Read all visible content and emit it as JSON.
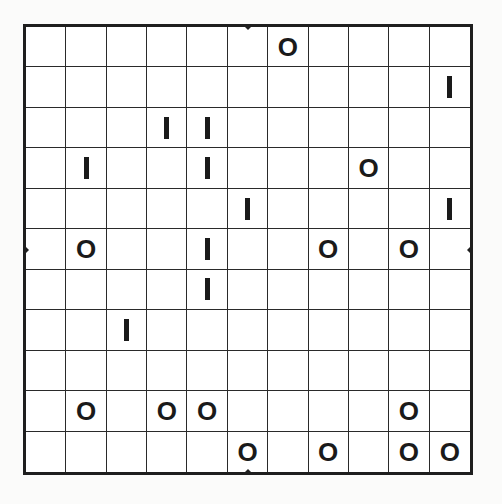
{
  "puzzle": {
    "rows": 11,
    "cols": 11,
    "colors": {
      "background": "#fbfbfa",
      "board": "#ffffff",
      "lines": "#2a2a2a",
      "glyph": "#1a1a1a"
    },
    "edge_markers": [
      {
        "side": "top",
        "position": "center"
      },
      {
        "side": "bottom",
        "position": "center"
      },
      {
        "side": "left",
        "position": "center"
      },
      {
        "side": "right",
        "position": "center"
      }
    ],
    "grid": [
      [
        "",
        "",
        "",
        "",
        "",
        "",
        "O",
        "",
        "",
        "",
        ""
      ],
      [
        "",
        "",
        "",
        "",
        "",
        "",
        "",
        "",
        "",
        "",
        "I"
      ],
      [
        "",
        "",
        "",
        "I",
        "I",
        "",
        "",
        "",
        "",
        "",
        ""
      ],
      [
        "",
        "I",
        "",
        "",
        "I",
        "",
        "",
        "",
        "O",
        "",
        ""
      ],
      [
        "",
        "",
        "",
        "",
        "",
        "I",
        "",
        "",
        "",
        "",
        "I"
      ],
      [
        "",
        "O",
        "",
        "",
        "I",
        "",
        "",
        "O",
        "",
        "O",
        ""
      ],
      [
        "",
        "",
        "",
        "",
        "I",
        "",
        "",
        "",
        "",
        "",
        ""
      ],
      [
        "",
        "",
        "I",
        "",
        "",
        "",
        "",
        "",
        "",
        "",
        ""
      ],
      [
        "",
        "",
        "",
        "",
        "",
        "",
        "",
        "",
        "",
        "",
        ""
      ],
      [
        "",
        "O",
        "",
        "O",
        "O",
        "",
        "",
        "",
        "",
        "O",
        ""
      ],
      [
        "",
        "",
        "",
        "",
        "",
        "O",
        "",
        "O",
        "",
        "O",
        "O"
      ]
    ]
  }
}
